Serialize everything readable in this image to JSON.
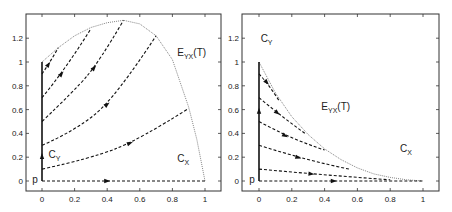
{
  "chart_data": [
    {
      "type": "line",
      "panel": "left",
      "title": "",
      "xlabel": "",
      "ylabel": "",
      "xlim": [
        -0.1,
        1.1
      ],
      "ylim": [
        -0.1,
        1.4
      ],
      "xticks": [
        0,
        0.2,
        0.4,
        0.6,
        0.8,
        1
      ],
      "xtick_labels": [
        "0",
        "0.2",
        "0.4",
        "0.6",
        "0.8",
        "1"
      ],
      "yticks": [
        0,
        0.2,
        0.4,
        0.6,
        0.8,
        1,
        1.2
      ],
      "ytick_labels": [
        "0",
        "0.2",
        "0.4",
        "0.6",
        "0.8",
        "1",
        "1.2"
      ],
      "grid": false,
      "annotations": [
        {
          "text": "E",
          "sub": "YX",
          "suffix": "(T)",
          "x": 0.83,
          "y": 1.05
        },
        {
          "text": "C",
          "sub": "Y",
          "x": 0.04,
          "y": 0.19
        },
        {
          "text": "C",
          "sub": "X",
          "x": 0.83,
          "y": 0.16
        },
        {
          "text": "p",
          "x": -0.06,
          "y": -0.02
        }
      ],
      "envelope": {
        "name": "E_YX(T)",
        "style": "dotted",
        "x": [
          0,
          0.1,
          0.2,
          0.3,
          0.4,
          0.5,
          0.6,
          0.7,
          0.8,
          0.9,
          0.95,
          1
        ],
        "y": [
          1.0,
          1.12,
          1.22,
          1.29,
          1.33,
          1.35,
          1.32,
          1.22,
          1.02,
          0.62,
          0.35,
          0.0
        ]
      },
      "axis_segment": {
        "name": "C_Y",
        "style": "solid",
        "x": [
          0,
          0
        ],
        "y": [
          0,
          1.0
        ]
      },
      "trajectories": [
        {
          "style": "dashed",
          "x": [
            0,
            0.9
          ],
          "y0": 0.0,
          "y1": 0.0,
          "points": [
            [
              0,
              0
            ],
            [
              0.5,
              0
            ],
            [
              1.0,
              0
            ]
          ]
        },
        {
          "style": "dashed",
          "points": [
            [
              0,
              0.1
            ],
            [
              0.3,
              0.19
            ],
            [
              0.6,
              0.35
            ],
            [
              0.9,
              0.61
            ]
          ]
        },
        {
          "style": "dashed",
          "points": [
            [
              0,
              0.3
            ],
            [
              0.2,
              0.42
            ],
            [
              0.45,
              0.7
            ],
            [
              0.7,
              1.22
            ]
          ]
        },
        {
          "style": "dashed",
          "points": [
            [
              0,
              0.5
            ],
            [
              0.2,
              0.76
            ],
            [
              0.35,
              1.0
            ],
            [
              0.5,
              1.35
            ]
          ]
        },
        {
          "style": "dashed",
          "points": [
            [
              0,
              0.7
            ],
            [
              0.15,
              0.95
            ],
            [
              0.3,
              1.28
            ]
          ]
        },
        {
          "style": "dashed",
          "points": [
            [
              0,
              0.9
            ],
            [
              0.05,
              1.0
            ],
            [
              0.1,
              1.12
            ]
          ]
        }
      ]
    },
    {
      "type": "line",
      "panel": "right",
      "title": "",
      "xlabel": "",
      "ylabel": "",
      "xlim": [
        -0.1,
        1.1
      ],
      "ylim": [
        -0.1,
        1.4
      ],
      "xticks": [
        0,
        0.2,
        0.4,
        0.6,
        0.8,
        1
      ],
      "xtick_labels": [
        "0",
        "0.2",
        "0.4",
        "0.6",
        "0.8",
        "1"
      ],
      "yticks": [
        0,
        0.2,
        0.4,
        0.6,
        0.8,
        1,
        1.2
      ],
      "ytick_labels": [
        "0",
        "0.2",
        "0.4",
        "0.6",
        "0.8",
        "1",
        "1.2"
      ],
      "grid": false,
      "annotations": [
        {
          "text": "E",
          "sub": "YX",
          "suffix": "(T)",
          "x": 0.38,
          "y": 0.6
        },
        {
          "text": "C",
          "sub": "Y",
          "x": 0.01,
          "y": 1.17
        },
        {
          "text": "C",
          "sub": "X",
          "x": 0.86,
          "y": 0.24
        },
        {
          "text": "p",
          "x": -0.06,
          "y": -0.02
        }
      ],
      "envelope": {
        "name": "E_YX(T)",
        "style": "dotted",
        "x": [
          0,
          0.1,
          0.2,
          0.3,
          0.4,
          0.5,
          0.6,
          0.7,
          0.8,
          0.9,
          1
        ],
        "y": [
          1.0,
          0.74,
          0.54,
          0.39,
          0.27,
          0.18,
          0.11,
          0.06,
          0.03,
          0.01,
          0.0
        ]
      },
      "axis_segment": {
        "name": "C_Y",
        "style": "solid",
        "x": [
          0,
          0
        ],
        "y": [
          0,
          1.0
        ]
      },
      "trajectories": [
        {
          "style": "dashed",
          "points": [
            [
              0,
              0.0
            ],
            [
              0.57,
              0.0
            ],
            [
              1.0,
              0.0
            ]
          ]
        },
        {
          "style": "dashed",
          "points": [
            [
              0,
              0.1
            ],
            [
              0.4,
              0.05
            ],
            [
              0.8,
              0.01
            ]
          ]
        },
        {
          "style": "dashed",
          "points": [
            [
              0,
              0.3
            ],
            [
              0.3,
              0.17
            ],
            [
              0.55,
              0.1
            ]
          ]
        },
        {
          "style": "dashed",
          "points": [
            [
              0,
              0.5
            ],
            [
              0.2,
              0.35
            ],
            [
              0.4,
              0.26
            ]
          ]
        },
        {
          "style": "dashed",
          "points": [
            [
              0,
              0.7
            ],
            [
              0.14,
              0.54
            ],
            [
              0.28,
              0.4
            ]
          ]
        },
        {
          "style": "dashed",
          "points": [
            [
              0,
              0.9
            ],
            [
              0.06,
              0.81
            ],
            [
              0.12,
              0.68
            ]
          ]
        }
      ]
    }
  ]
}
